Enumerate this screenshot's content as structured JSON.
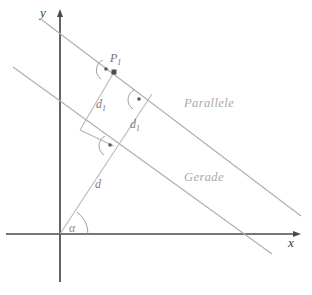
{
  "figure": {
    "type": "geometry-diagram",
    "title": "",
    "background_color": "#ffffff",
    "width": 312,
    "height": 295
  },
  "axes": {
    "x_label": "x",
    "y_label": "y",
    "axis_color": "#4a4a4a",
    "origin": {
      "x": 60,
      "y": 234
    },
    "x_axis": {
      "start": {
        "x": 6,
        "y": 234
      },
      "end": {
        "x": 298,
        "y": 234
      }
    },
    "y_axis": {
      "start": {
        "x": 60,
        "y": 282
      },
      "end": {
        "x": 60,
        "y": 10
      }
    }
  },
  "lines": [
    {
      "name": "parallele",
      "label": "Parallele",
      "color": "#aaaaaa",
      "label_position": {
        "x": 186,
        "y": 103
      },
      "start": {
        "x": 42,
        "y": 20
      },
      "end": {
        "x": 301,
        "y": 216
      }
    },
    {
      "name": "gerade",
      "label": "Gerade",
      "color": "#aaaaaa",
      "label_position": {
        "x": 186,
        "y": 177
      },
      "start": {
        "x": 13,
        "y": 67
      },
      "end": {
        "x": 272,
        "y": 254
      }
    }
  ],
  "segments": [
    {
      "name": "d-segment",
      "label": "d",
      "label_position": {
        "x": 96,
        "y": 184
      },
      "description": "distance from origin perpendicular to Gerade",
      "color": "#b2b2b2"
    },
    {
      "name": "d1-segment-left",
      "label": "d1",
      "label_position": {
        "x": 98,
        "y": 104
      },
      "description": "distance from P1 perpendicular down to Gerade",
      "color": "#b2b2b2"
    },
    {
      "name": "d1-segment-right",
      "label": "d1",
      "label_position": {
        "x": 132,
        "y": 124
      },
      "description": "distance between Parallele and Gerade along origin ray",
      "color": "#b2b2b2"
    }
  ],
  "points": [
    {
      "name": "P1",
      "label": "P",
      "subscript": "1",
      "label_position": {
        "x": 109,
        "y": 55
      },
      "marker": {
        "x": 114,
        "y": 72
      },
      "marker_color": "#555555"
    }
  ],
  "angles": [
    {
      "name": "alpha-angle",
      "label": "α",
      "label_position": {
        "x": 71,
        "y": 221
      },
      "vertex": {
        "x": 60,
        "y": 234
      },
      "description": "inclination angle of the line at the origin",
      "color": "#9a9a9a"
    },
    {
      "name": "right-angle-at-p1",
      "label": "",
      "vertex": {
        "x": 114,
        "y": 72
      },
      "description": "right angle marker at P1",
      "color": "#9a9a9a"
    },
    {
      "name": "right-angle-mid",
      "label": "",
      "vertex": {
        "x": 144,
        "y": 100
      },
      "description": "right angle marker on Parallele",
      "color": "#9a9a9a"
    },
    {
      "name": "right-angle-lower",
      "label": "",
      "vertex": {
        "x": 114,
        "y": 146
      },
      "description": "right angle marker on Gerade",
      "color": "#9a9a9a"
    }
  ]
}
